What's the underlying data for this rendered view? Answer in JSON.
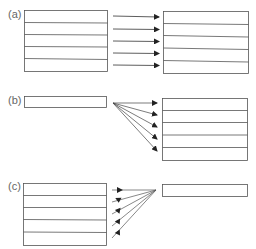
{
  "panels": [
    {
      "label": "(a)",
      "description": "one-to-one mapping: 5 rows to 5 rows"
    },
    {
      "label": "(b)",
      "description": "one-to-many mapping: 1 row to 5 rows"
    },
    {
      "label": "(c)",
      "description": "many-to-one mapping: 5 rows to 1 row"
    }
  ],
  "colors": {
    "line": "#555555",
    "arrow": "#222222",
    "label": "#666666"
  }
}
